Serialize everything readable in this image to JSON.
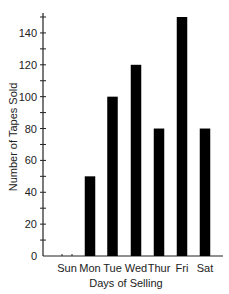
{
  "chart_data": {
    "type": "bar",
    "title": "",
    "xlabel": "Days of Selling",
    "ylabel": "Number of Tapes Sold",
    "categories": [
      "Sun",
      "Mon",
      "Tue",
      "Wed",
      "Thur",
      "Fri",
      "Sat"
    ],
    "values": [
      0,
      50,
      100,
      120,
      80,
      150,
      80
    ],
    "ylim": [
      0,
      150
    ],
    "yticks": [
      0,
      20,
      40,
      60,
      80,
      100,
      120,
      140
    ],
    "grid": false,
    "legend": null,
    "bar_color": "#000000"
  }
}
